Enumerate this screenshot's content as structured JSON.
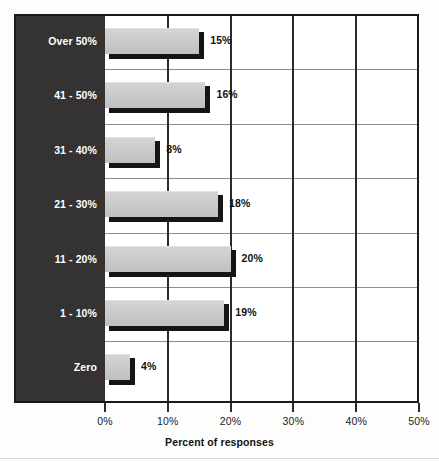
{
  "chart_data": {
    "type": "bar",
    "orientation": "horizontal",
    "title": "",
    "xlabel": "Percent of responses",
    "ylabel": "",
    "xlim": [
      0,
      50
    ],
    "xticks": [
      "0%",
      "10%",
      "20%",
      "30%",
      "40%",
      "50%"
    ],
    "xtick_values": [
      0,
      10,
      20,
      30,
      40,
      50
    ],
    "grid": true,
    "legend": false,
    "categories": [
      "Over 50%",
      "41 - 50%",
      "31 - 40%",
      "21 - 30%",
      "11 - 20%",
      "1 - 10%",
      "Zero"
    ],
    "values": [
      15,
      16,
      8,
      18,
      20,
      19,
      4
    ],
    "data_labels": [
      "15%",
      "16%",
      "8%",
      "18%",
      "20%",
      "19%",
      "4%"
    ],
    "colors": {
      "bar_fill": "#c9c9c9",
      "bar_shadow": "#151515",
      "category_panel": "#333132",
      "category_text": "#ffffff",
      "grid_vertical": "#2b2b2b",
      "grid_horizontal": "#8d8d8d",
      "frame": "#1a1a1a",
      "background": "#fdfdfc",
      "label_text": "#111111"
    }
  },
  "axis": {
    "x_title": "Percent of responses"
  }
}
